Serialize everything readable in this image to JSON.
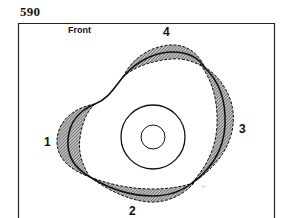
{
  "figure": {
    "number": "590",
    "orientation_label": "Front",
    "region_labels": [
      "1",
      "2",
      "3",
      "4"
    ],
    "tiny_mark": "″″"
  },
  "colors": {
    "stroke": "#111111",
    "hatch": "#555555",
    "background": "#ffffff"
  },
  "diagram": {
    "center_circles": {
      "cx": 153,
      "cy": 137,
      "outer_radius": 32,
      "inner_radius": 12
    },
    "lobes": [
      {
        "id": "1",
        "position": "left"
      },
      {
        "id": "2",
        "position": "bottom"
      },
      {
        "id": "3",
        "position": "right"
      },
      {
        "id": "4",
        "position": "top"
      }
    ]
  }
}
